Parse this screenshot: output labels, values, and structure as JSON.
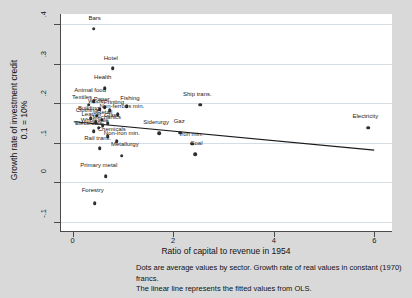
{
  "chart_data": {
    "type": "scatter",
    "title": "",
    "xlabel": "Ratio of capital to revenue in 1954",
    "ylabel_line1": "Growth rate of investment credit",
    "ylabel_line2": "0.1 = 10%",
    "xlim": [
      -0.25,
      6.35
    ],
    "ylim": [
      -0.125,
      0.425
    ],
    "xticks": [
      "0",
      "2",
      "4",
      "6"
    ],
    "xtick_values": [
      0,
      2,
      4,
      6
    ],
    "yticks": [
      ".4",
      ".3",
      ".2",
      ".1",
      "0",
      "-.1"
    ],
    "ytick_values": [
      0.4,
      0.3,
      0.2,
      0.1,
      0,
      -0.1
    ],
    "grid": "horizontal",
    "legend": "none",
    "points": [
      {
        "label": "Bars",
        "x": 0.4,
        "y": 0.388,
        "lx": 0.42,
        "ly": 0.405
      },
      {
        "label": "Hotel",
        "x": 0.78,
        "y": 0.288,
        "lx": 0.74,
        "ly": 0.305
      },
      {
        "label": "Health",
        "x": 0.62,
        "y": 0.238,
        "lx": 0.58,
        "ly": 0.256
      },
      {
        "label": "Animal food",
        "x": 0.4,
        "y": 0.205,
        "lx": 0.33,
        "ly": 0.222
      },
      {
        "label": "Textiles",
        "x": 0.3,
        "y": 0.196,
        "lx": 0.17,
        "ly": 0.206
      },
      {
        "label": "Fishing",
        "x": 1.06,
        "y": 0.193,
        "lx": 1.12,
        "ly": 0.203
      },
      {
        "label": "Ship trans.",
        "x": 2.52,
        "y": 0.196,
        "lx": 2.46,
        "ly": 0.214
      },
      {
        "label": "Paper",
        "x": 0.62,
        "y": 0.19,
        "lx": 0.56,
        "ly": 0.2
      },
      {
        "label": "Wood",
        "x": 0.52,
        "y": 0.185,
        "lx": 0.44,
        "ly": 0.195
      },
      {
        "label": "Printing",
        "x": 0.72,
        "y": 0.182,
        "lx": 0.8,
        "ly": 0.192
      },
      {
        "label": "Non-ferrous min.",
        "x": 0.88,
        "y": 0.172,
        "lx": 0.96,
        "ly": 0.182
      },
      {
        "label": "Building",
        "x": 0.46,
        "y": 0.168,
        "lx": 0.3,
        "ly": 0.178
      },
      {
        "label": "Clothing",
        "x": 0.34,
        "y": 0.162,
        "lx": 0.26,
        "ly": 0.172
      },
      {
        "label": "Retail",
        "x": 0.56,
        "y": 0.158,
        "lx": 0.62,
        "ly": 0.168
      },
      {
        "label": "Leather",
        "x": 0.44,
        "y": 0.152,
        "lx": 0.36,
        "ly": 0.162
      },
      {
        "label": "Glass",
        "x": 0.68,
        "y": 0.15,
        "lx": 0.76,
        "ly": 0.16
      },
      {
        "label": "Mechanics",
        "x": 0.58,
        "y": 0.144,
        "lx": 0.66,
        "ly": 0.154
      },
      {
        "label": "Wholesale",
        "x": 0.5,
        "y": 0.138,
        "lx": 0.42,
        "ly": 0.148
      },
      {
        "label": "Electricals",
        "x": 0.4,
        "y": 0.13,
        "lx": 0.3,
        "ly": 0.14
      },
      {
        "label": "Siderurgy",
        "x": 1.7,
        "y": 0.124,
        "lx": 1.64,
        "ly": 0.142
      },
      {
        "label": "Gaz",
        "x": 2.12,
        "y": 0.126,
        "lx": 2.1,
        "ly": 0.144
      },
      {
        "label": "Electricity",
        "x": 5.86,
        "y": 0.138,
        "lx": 5.8,
        "ly": 0.158
      },
      {
        "label": "Chemicals",
        "x": 0.68,
        "y": 0.116,
        "lx": 0.76,
        "ly": 0.126
      },
      {
        "label": "Non-iron min.",
        "x": 0.86,
        "y": 0.104,
        "lx": 0.96,
        "ly": 0.114
      },
      {
        "label": "Iron min.",
        "x": 2.36,
        "y": 0.098,
        "lx": 2.34,
        "ly": 0.112
      },
      {
        "label": "Rail trans.",
        "x": 0.52,
        "y": 0.086,
        "lx": 0.48,
        "ly": 0.102
      },
      {
        "label": "Coal",
        "x": 2.42,
        "y": 0.072,
        "lx": 2.44,
        "ly": 0.09
      },
      {
        "label": "Metallurgy",
        "x": 0.96,
        "y": 0.068,
        "lx": 1.02,
        "ly": 0.086
      },
      {
        "label": "Primary metal",
        "x": 0.64,
        "y": 0.016,
        "lx": 0.5,
        "ly": 0.034
      },
      {
        "label": "Forestry",
        "x": 0.42,
        "y": -0.052,
        "lx": 0.38,
        "ly": -0.03
      }
    ],
    "fit_line": {
      "name": "OLS fitted values",
      "x1": 0.0,
      "y1": 0.152,
      "x2": 6.0,
      "y2": 0.08
    }
  },
  "caption": {
    "line1": "Dots are average values by sector. Growth rate of real values in constant (1970) francs.",
    "line2": "The linear line represents the fitted values from OLS."
  }
}
